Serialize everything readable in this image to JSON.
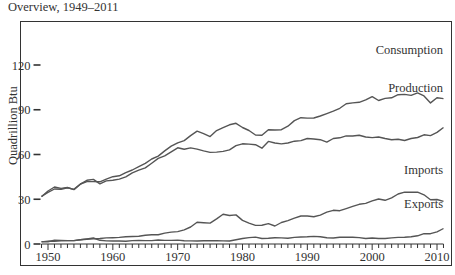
{
  "title": "Overview, 1949–2011",
  "chart_data": {
    "type": "line",
    "title": "Overview, 1949–2011",
    "xlabel": "",
    "ylabel": "Quadrillion Btu",
    "xlim": [
      1949,
      2011
    ],
    "ylim": [
      0,
      120
    ],
    "yticks": [
      0,
      30,
      60,
      90,
      120
    ],
    "xticks": [
      1950,
      1960,
      1970,
      1980,
      1990,
      2000,
      2010
    ],
    "grid": false,
    "legend": "inline labels at right end of each series",
    "x": [
      1949,
      1950,
      1951,
      1952,
      1953,
      1954,
      1955,
      1956,
      1957,
      1958,
      1959,
      1960,
      1961,
      1962,
      1963,
      1964,
      1965,
      1966,
      1967,
      1968,
      1969,
      1970,
      1971,
      1972,
      1973,
      1974,
      1975,
      1976,
      1977,
      1978,
      1979,
      1980,
      1981,
      1982,
      1983,
      1984,
      1985,
      1986,
      1987,
      1988,
      1989,
      1990,
      1991,
      1992,
      1993,
      1994,
      1995,
      1996,
      1997,
      1998,
      1999,
      2000,
      2001,
      2002,
      2003,
      2004,
      2005,
      2006,
      2007,
      2008,
      2009,
      2010,
      2011
    ],
    "series": [
      {
        "name": "Consumption",
        "values": [
          32,
          34.6,
          36.9,
          36.7,
          37.7,
          36.6,
          40.2,
          41.8,
          41.8,
          41.7,
          43.5,
          45.1,
          45.7,
          47.8,
          49.6,
          51.8,
          54.0,
          57.0,
          58.9,
          62.4,
          65.6,
          67.8,
          69.3,
          72.7,
          75.7,
          74.0,
          72.0,
          76.0,
          78.0,
          79.9,
          80.9,
          78.1,
          76.1,
          73.1,
          72.9,
          76.6,
          76.4,
          76.6,
          79.0,
          82.7,
          84.7,
          84.4,
          84.5,
          85.8,
          87.4,
          89.1,
          91.0,
          94.0,
          94.6,
          95.0,
          96.6,
          98.8,
          96.2,
          97.6,
          98.0,
          100.1,
          100.3,
          99.6,
          101.3,
          99.3,
          94.6,
          98.0,
          97.5
        ]
      },
      {
        "name": "Production",
        "values": [
          31.7,
          35.5,
          38.2,
          37.3,
          37.9,
          36.5,
          40.1,
          42.7,
          43.3,
          40.3,
          42.3,
          42.8,
          43.5,
          45.0,
          47.7,
          49.5,
          51.0,
          54.2,
          57.4,
          59.1,
          61.8,
          64.5,
          63.5,
          64.4,
          63.6,
          62.4,
          61.4,
          61.6,
          62.1,
          63.1,
          65.9,
          67.2,
          67.0,
          66.6,
          64.2,
          68.8,
          67.7,
          67.1,
          67.7,
          68.9,
          69.3,
          70.7,
          70.4,
          69.9,
          68.3,
          70.7,
          71.2,
          72.5,
          72.4,
          72.9,
          71.7,
          71.3,
          71.7,
          70.7,
          69.9,
          70.2,
          69.4,
          70.7,
          71.4,
          73.2,
          72.7,
          74.8,
          78.1
        ]
      },
      {
        "name": "Imports",
        "values": [
          1.4,
          1.9,
          1.9,
          2.1,
          2.3,
          2.3,
          2.8,
          3.2,
          3.4,
          3.7,
          4.1,
          4.2,
          4.4,
          4.8,
          5.0,
          5.2,
          5.9,
          6.2,
          6.2,
          7.3,
          8.0,
          8.3,
          9.5,
          11.4,
          14.6,
          14.3,
          14.0,
          16.8,
          19.9,
          19.1,
          19.5,
          15.8,
          14.0,
          12.5,
          12.6,
          13.7,
          12.1,
          14.4,
          15.7,
          17.3,
          18.8,
          18.8,
          18.3,
          19.4,
          21.3,
          22.6,
          22.3,
          23.7,
          25.2,
          26.6,
          27.2,
          28.9,
          30.2,
          29.3,
          31.0,
          33.5,
          34.7,
          34.7,
          34.7,
          33.0,
          29.7,
          29.8,
          28.6
        ]
      },
      {
        "name": "Exports",
        "values": [
          1.6,
          1.5,
          2.6,
          2.4,
          2.3,
          2.3,
          2.9,
          3.4,
          4.0,
          2.5,
          2.1,
          2.0,
          2.0,
          1.9,
          2.3,
          2.4,
          2.3,
          2.3,
          2.7,
          2.4,
          2.4,
          2.6,
          2.2,
          2.1,
          2.0,
          2.2,
          2.3,
          2.2,
          2.1,
          2.0,
          2.9,
          3.7,
          4.3,
          4.6,
          3.7,
          3.8,
          4.2,
          4.1,
          3.8,
          4.4,
          4.7,
          4.8,
          5.1,
          4.9,
          4.2,
          4.0,
          4.5,
          4.6,
          4.5,
          4.3,
          3.7,
          4.0,
          3.7,
          3.7,
          4.1,
          4.4,
          4.5,
          4.9,
          5.5,
          7.0,
          6.9,
          8.2,
          10.4
        ]
      }
    ]
  },
  "labels": {
    "consumption": "Consumption",
    "production": "Production",
    "imports": "Imports",
    "exports": "Exports"
  }
}
